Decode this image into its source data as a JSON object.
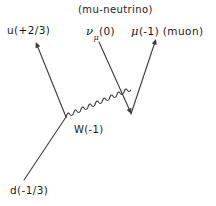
{
  "diagram": {
    "kind": "feynman-diagram",
    "title_annotation": "(mu-neutrino)",
    "background_color": "#ffffff",
    "stroke_color": "#3a3a3a",
    "labels": {
      "up_quark": "u(+2/3)",
      "down_quark": "d(-1/3)",
      "w_boson": "W(-1)",
      "muon": "(-1) (muon)",
      "muon_symbol": "μ",
      "neutrino_symbol": "ν",
      "neutrino_subscript": "μ",
      "neutrino_charge": "(0)"
    },
    "particles": [
      {
        "name": "down-quark",
        "symbol": "d",
        "charge": "-1/3",
        "label": "d(-1/3)",
        "role": "incoming",
        "has_arrowhead": false,
        "line_style": "straight"
      },
      {
        "name": "up-quark",
        "symbol": "u",
        "charge": "+2/3",
        "label": "u(+2/3)",
        "role": "outgoing",
        "has_arrowhead": true,
        "line_style": "straight"
      },
      {
        "name": "w-boson",
        "symbol": "W",
        "charge": "-1",
        "label": "W(-1)",
        "role": "propagator",
        "has_arrowhead": false,
        "line_style": "wavy"
      },
      {
        "name": "mu-neutrino",
        "symbol": "νμ",
        "charge": "0",
        "label": "νμ(0)",
        "role": "incoming",
        "has_arrowhead": true,
        "line_style": "straight"
      },
      {
        "name": "muon",
        "symbol": "μ",
        "charge": "-1",
        "label": "μ(-1) (muon)",
        "role": "outgoing",
        "has_arrowhead": true,
        "line_style": "straight"
      }
    ],
    "vertices": [
      {
        "name": "quark-vertex",
        "x": 66,
        "y": 117
      },
      {
        "name": "lepton-vertex",
        "x": 131,
        "y": 114
      }
    ]
  }
}
